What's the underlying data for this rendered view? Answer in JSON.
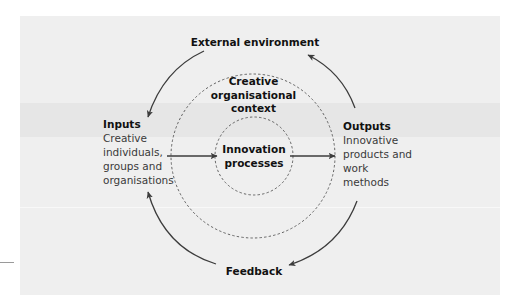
{
  "diagram": {
    "title_top": "External environment",
    "title_bottom": "Feedback",
    "context_label": "Creative\norganisational\ncontext",
    "core_label": "Innovation\nprocesses",
    "inputs": {
      "heading": "Inputs",
      "body": "Creative\nindividuals,\ngroups and\norganisations"
    },
    "outputs": {
      "heading": "Outputs",
      "body": "Innovative\nproducts and\nwork\nmethods"
    },
    "edges": [
      {
        "from": "External environment",
        "to": "Inputs"
      },
      {
        "from": "Inputs",
        "to": "Innovation processes"
      },
      {
        "from": "Innovation processes",
        "to": "Outputs"
      },
      {
        "from": "Outputs",
        "to": "External environment"
      },
      {
        "from": "Outputs",
        "to": "Feedback"
      },
      {
        "from": "Feedback",
        "to": "Inputs"
      }
    ],
    "colors": {
      "panel": "#efefef",
      "band": "#e6e6e6",
      "stroke": "#3c3c3c",
      "dashed": "#555555",
      "heading_text": "#111111",
      "body_text": "#3a3a3a"
    }
  }
}
